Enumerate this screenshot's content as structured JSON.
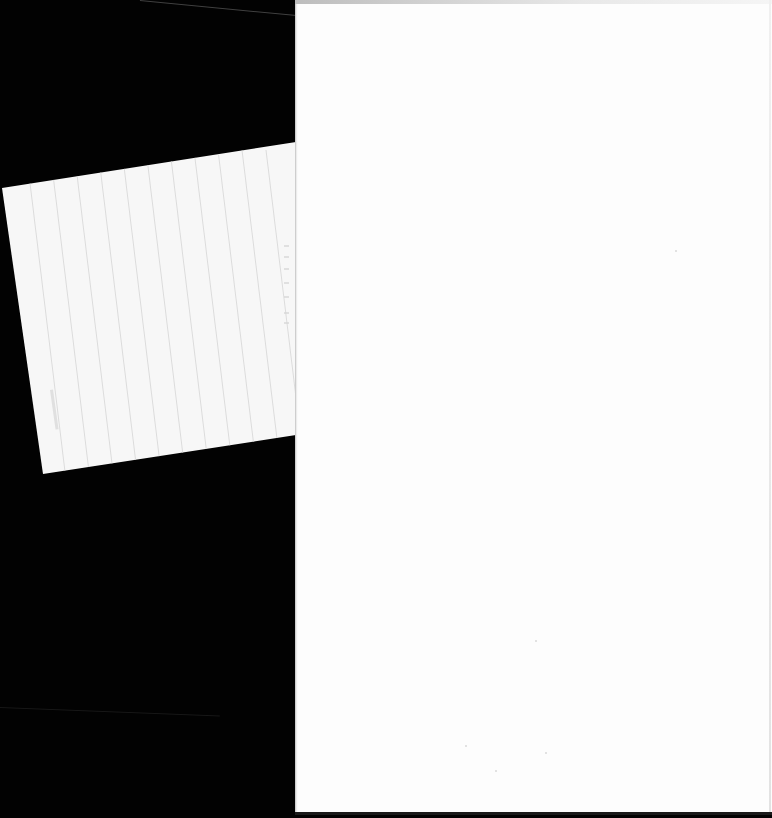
{
  "document": {
    "type": "scanned-pages",
    "background_color": "#000000",
    "page_color": "#fdfdfd",
    "card_color": "#f7f7f7",
    "card_rule_color": "#dcdcdc",
    "left_card": {
      "description": "tilted faded ruled card, text illegible",
      "text": ""
    },
    "right_page": {
      "description": "blank page",
      "text": ""
    }
  }
}
